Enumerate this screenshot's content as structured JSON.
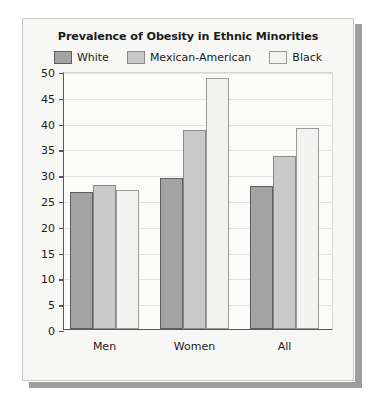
{
  "figure": {
    "title": "Prevalence of Obesity in Ethnic Minorities",
    "panel_background": "#f7f7f5",
    "panel_border": "#c9c9c6",
    "shadow_color": "#9d9d9b",
    "plot_background": "#fbfbfa",
    "axis_color": "#58585a",
    "grid_color": "#e2e2de"
  },
  "legend": {
    "position": "top",
    "items": [
      {
        "label": "White",
        "fill": "#a3a3a3",
        "stroke": "#5e5e5e",
        "swatch_name": "legend-swatch-white"
      },
      {
        "label": "Mexican-American",
        "fill": "#c9c9c9",
        "stroke": "#8a8a8a",
        "swatch_name": "legend-swatch-mexican-american"
      },
      {
        "label": "Black",
        "fill": "#f2f2f0",
        "stroke": "#9a9a9a",
        "swatch_name": "legend-swatch-black"
      }
    ]
  },
  "chart_data": {
    "type": "bar",
    "title": "Prevalence of Obesity in Ethnic Minorities",
    "xlabel": "",
    "ylabel": "",
    "categories": [
      "Men",
      "Women",
      "All"
    ],
    "series": [
      {
        "name": "White",
        "values": [
          26.5,
          29.2,
          27.8
        ],
        "fill": "#a3a3a3",
        "stroke": "#5e5e5e"
      },
      {
        "name": "Mexican-American",
        "values": [
          28.0,
          38.5,
          33.6
        ],
        "fill": "#c9c9c9",
        "stroke": "#8a8a8a"
      },
      {
        "name": "Black",
        "values": [
          27.0,
          48.6,
          39.0
        ],
        "fill": "#f2f2f0",
        "stroke": "#9a9a9a"
      }
    ],
    "ylim": [
      0,
      50
    ],
    "ytick_step": 5,
    "yticks": [
      0,
      5,
      10,
      15,
      20,
      25,
      30,
      35,
      40,
      45,
      50
    ],
    "ytick_labels": [
      "0",
      "5",
      "10",
      "15",
      "20",
      "25",
      "30",
      "35",
      "40",
      "45",
      "50"
    ],
    "grid": true,
    "grid_axis": "y",
    "legend_position": "top"
  }
}
